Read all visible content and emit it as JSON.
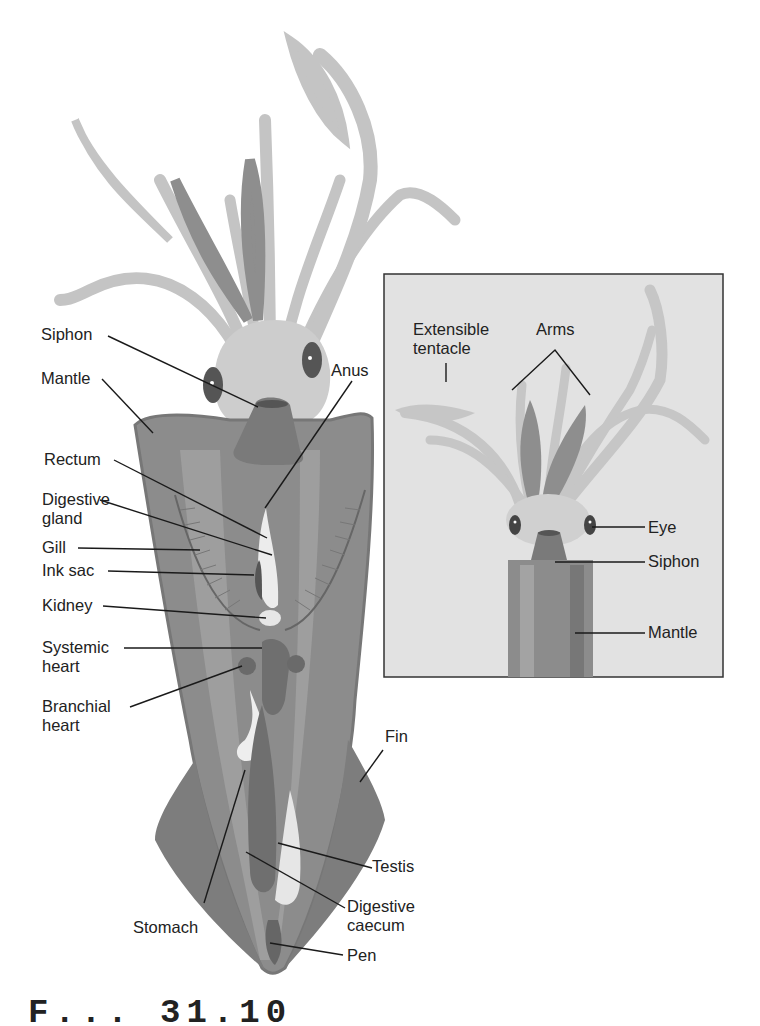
{
  "figure": {
    "caption_partial": "F...  31.10",
    "main_labels": {
      "siphon": "Siphon",
      "mantle": "Mantle",
      "anus": "Anus",
      "rectum": "Rectum",
      "digestive_gland_1": "Digestive",
      "digestive_gland_2": "gland",
      "gill": "Gill",
      "ink_sac": "Ink sac",
      "kidney": "Kidney",
      "systemic_heart_1": "Systemic",
      "systemic_heart_2": "heart",
      "branchial_heart_1": "Branchial",
      "branchial_heart_2": "heart",
      "fin": "Fin",
      "testis": "Testis",
      "digestive_caecum_1": "Digestive",
      "digestive_caecum_2": "caecum",
      "stomach": "Stomach",
      "pen": "Pen"
    },
    "inset_labels": {
      "extensible_tentacle_1": "Extensible",
      "extensible_tentacle_2": "tentacle",
      "arms": "Arms",
      "eye": "Eye",
      "siphon": "Siphon",
      "mantle": "Mantle"
    },
    "colors": {
      "background": "#ffffff",
      "inset_background": "#e2e2e2",
      "mantle": "#8c8c8c",
      "mantle_light": "#a3a3a3",
      "arms": "#c4c4c4",
      "suckers": "#8e8e8e",
      "organ_dark": "#6f6f6f",
      "organ_light": "#ececec",
      "leader_line": "#1a1a1a"
    }
  }
}
